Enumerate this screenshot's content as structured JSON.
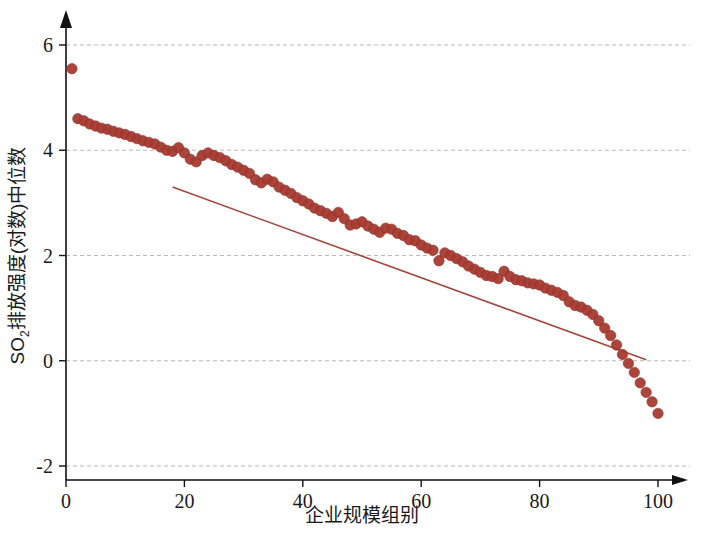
{
  "chart_data": {
    "type": "scatter",
    "title": "",
    "xlabel": "企业规模组别",
    "ylabel": "SO2排放强度(对数)中位数",
    "ylabel_main": "SO",
    "ylabel_sub": "2",
    "ylabel_rest": "排放强度(对数)中位数",
    "xlim": [
      -1.5,
      103
    ],
    "ylim": [
      -2.45,
      6.45
    ],
    "grid": true,
    "legend": "none",
    "marker_color": "#a63b32",
    "marker_edge_color": "#8e2f28",
    "line_color": "#a4453c",
    "grid_color": "#b9b9b9",
    "axis_color": "#111111",
    "xticks": [
      0,
      20,
      40,
      60,
      80,
      100
    ],
    "xtick_labels": [
      "0",
      "20",
      "40",
      "60",
      "80",
      "100"
    ],
    "yticks": [
      -2,
      0,
      2,
      4,
      6
    ],
    "ytick_labels": [
      "-2",
      "0",
      "2",
      "4",
      "6"
    ],
    "trendline": {
      "x_start": 18.0,
      "y_start": 3.3,
      "x_end": 98.0,
      "y_end": 0.02
    },
    "x": [
      1,
      2,
      3,
      4,
      5,
      6,
      7,
      8,
      9,
      10,
      11,
      12,
      13,
      14,
      15,
      16,
      17,
      18,
      19,
      20,
      21,
      22,
      23,
      24,
      25,
      26,
      27,
      28,
      29,
      30,
      31,
      32,
      33,
      34,
      35,
      36,
      37,
      38,
      39,
      40,
      41,
      42,
      43,
      44,
      45,
      46,
      47,
      48,
      49,
      50,
      51,
      52,
      53,
      54,
      55,
      56,
      57,
      58,
      59,
      60,
      61,
      62,
      63,
      64,
      65,
      66,
      67,
      68,
      69,
      70,
      71,
      72,
      73,
      74,
      75,
      76,
      77,
      78,
      79,
      80,
      81,
      82,
      83,
      84,
      85,
      86,
      87,
      88,
      89,
      90,
      91,
      92,
      93,
      94,
      95,
      96,
      97,
      98,
      99,
      100
    ],
    "y": [
      5.55,
      4.6,
      4.56,
      4.5,
      4.46,
      4.42,
      4.4,
      4.36,
      4.33,
      4.3,
      4.26,
      4.22,
      4.18,
      4.15,
      4.12,
      4.06,
      4.0,
      3.98,
      4.05,
      3.95,
      3.83,
      3.78,
      3.9,
      3.95,
      3.9,
      3.86,
      3.8,
      3.73,
      3.68,
      3.62,
      3.56,
      3.44,
      3.38,
      3.45,
      3.4,
      3.3,
      3.24,
      3.18,
      3.1,
      3.04,
      2.98,
      2.9,
      2.85,
      2.8,
      2.74,
      2.82,
      2.7,
      2.58,
      2.6,
      2.64,
      2.56,
      2.5,
      2.44,
      2.52,
      2.5,
      2.42,
      2.38,
      2.3,
      2.28,
      2.2,
      2.14,
      2.1,
      1.9,
      2.05,
      2.0,
      1.94,
      1.88,
      1.8,
      1.74,
      1.68,
      1.62,
      1.6,
      1.56,
      1.7,
      1.6,
      1.54,
      1.52,
      1.48,
      1.46,
      1.44,
      1.38,
      1.34,
      1.3,
      1.24,
      1.12,
      1.05,
      1.02,
      0.96,
      0.88,
      0.76,
      0.62,
      0.48,
      0.3,
      0.12,
      -0.05,
      -0.22,
      -0.42,
      -0.6,
      -0.78,
      -1.0
    ]
  }
}
